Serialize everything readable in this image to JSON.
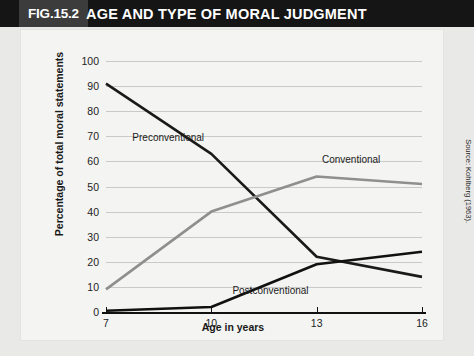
{
  "header": {
    "figure_number": "FIG.15.2",
    "title": "AGE AND TYPE OF MORAL JUDGMENT"
  },
  "source_note": "Source: Kohlberg (1963).",
  "colors": {
    "header_bar": "#151515",
    "figure_number_block": "#3c3c3c",
    "panel_background": "#f4f4f2",
    "outer_background": "#e9e9e7",
    "gridline": "#c9c9c7",
    "axis": "#111111",
    "preconventional": "#1a1a1a",
    "conventional": "#8f8f8f",
    "postconventional": "#111111"
  },
  "chart_data": {
    "type": "line",
    "title": "AGE AND TYPE OF MORAL JUDGMENT",
    "xlabel": "Age in years",
    "ylabel": "Percentage of total moral statements",
    "x": [
      7,
      10,
      13,
      16
    ],
    "xtick_labels": [
      "7",
      "10",
      "13",
      "16"
    ],
    "ytick_labels": [
      "0",
      "10",
      "20",
      "30",
      "40",
      "50",
      "60",
      "70",
      "80",
      "90",
      "100"
    ],
    "ylim": [
      0,
      100
    ],
    "xlim": [
      7,
      16
    ],
    "grid": true,
    "legend": "inline-labels",
    "series": [
      {
        "name": "Preconventional",
        "values": [
          91,
          63,
          22,
          14
        ],
        "color": "#1a1a1a",
        "label_x": 7.75,
        "label_y": 69
      },
      {
        "name": "Conventional",
        "values": [
          9,
          40,
          54,
          51
        ],
        "color": "#8f8f8f",
        "label_x": 13.15,
        "label_y": 60
      },
      {
        "name": "Postconventional",
        "values": [
          0.5,
          2,
          19,
          24
        ],
        "color": "#111111",
        "label_x": 10.6,
        "label_y": 8
      }
    ]
  }
}
